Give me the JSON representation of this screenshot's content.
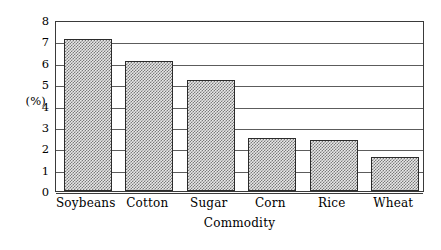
{
  "chart_data": {
    "type": "bar",
    "title": "",
    "subtitle": "",
    "categories": [
      "Soybeans",
      "Cotton",
      "Sugar",
      "Corn",
      "Rice",
      "Wheat"
    ],
    "values": [
      7.1,
      6.1,
      5.2,
      2.5,
      2.4,
      1.6
    ],
    "xlabel": "Commodity",
    "ylabel": "(%)",
    "ylim": [
      0,
      8
    ],
    "ytick_labels": [
      "0",
      "1",
      "2",
      "3",
      "4",
      "5",
      "6",
      "7",
      "8"
    ],
    "ytick_values": [
      0,
      1,
      2,
      3,
      4,
      5,
      6,
      7,
      8
    ],
    "grid": "horizontal",
    "legend": "none",
    "series": [
      {
        "name": "Share",
        "values": [
          7.1,
          6.1,
          5.2,
          2.5,
          2.4,
          1.6
        ]
      }
    ],
    "colors": {
      "bar_fill": "#d0d0d0",
      "bar_edge": "#2b2b2b",
      "gridline": "#5c5c5c",
      "axis": "#3a3a3a",
      "background": "#ffffff",
      "text": "#000000"
    }
  }
}
